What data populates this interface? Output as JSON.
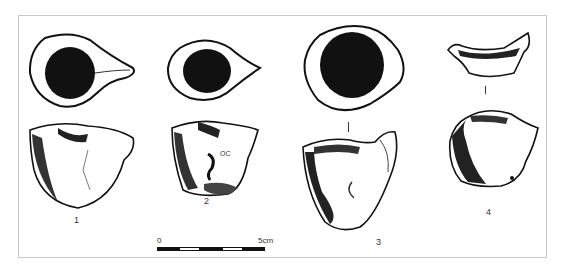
{
  "figure": {
    "objects": [
      {
        "id": "1",
        "label": "1",
        "views": [
          "top view",
          "side view"
        ]
      },
      {
        "id": "2",
        "label": "2",
        "views": [
          "top view",
          "side view"
        ],
        "inscription": "OC"
      },
      {
        "id": "3",
        "label": "3",
        "views": [
          "top view",
          "side view"
        ]
      },
      {
        "id": "4",
        "label": "4",
        "views": [
          "top view",
          "side view"
        ]
      }
    ],
    "scale": {
      "start_label": "0",
      "end_label": "5cm",
      "segments": [
        "black",
        "white",
        "black",
        "white",
        "black"
      ]
    }
  }
}
